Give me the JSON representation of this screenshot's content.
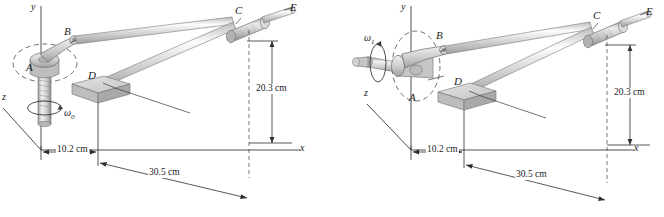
{
  "figure": {
    "background": "#ffffff",
    "line_color": "#333333",
    "metal_light": "#e8e8e8",
    "metal_mid": "#c3c3c3",
    "metal_dark": "#9a9a9a",
    "dash_color": "#555555"
  },
  "panels": [
    {
      "id": "left",
      "name": "vertical-shaft-configuration",
      "axes": {
        "x": "x",
        "y": "y",
        "z": "z"
      },
      "omega": {
        "symbol": "ω",
        "subscript": "0",
        "axis": "y",
        "label": "ω0"
      },
      "points": [
        {
          "id": "A",
          "label": "A"
        },
        {
          "id": "B",
          "label": "B"
        },
        {
          "id": "C",
          "label": "C"
        },
        {
          "id": "D",
          "label": "D"
        },
        {
          "id": "E",
          "label": "E"
        }
      ],
      "dimensions": [
        {
          "id": "d1",
          "label": "10.2 cm",
          "value": 10.2,
          "unit": "cm",
          "orientation": "horizontal"
        },
        {
          "id": "d2",
          "label": "30.5 cm",
          "value": 30.5,
          "unit": "cm",
          "orientation": "horizontal"
        },
        {
          "id": "d3",
          "label": "20.3 cm",
          "value": 20.3,
          "unit": "cm",
          "orientation": "vertical"
        }
      ]
    },
    {
      "id": "right",
      "name": "horizontal-shaft-configuration",
      "axes": {
        "x": "x",
        "y": "y",
        "z": "z"
      },
      "omega": {
        "symbol": "ω",
        "subscript": "1",
        "axis": "z",
        "label": "ω1"
      },
      "points": [
        {
          "id": "A",
          "label": "A"
        },
        {
          "id": "B",
          "label": "B"
        },
        {
          "id": "C",
          "label": "C"
        },
        {
          "id": "D",
          "label": "D"
        },
        {
          "id": "E",
          "label": "E"
        }
      ],
      "dimensions": [
        {
          "id": "d1",
          "label": "10.2 cm",
          "value": 10.2,
          "unit": "cm",
          "orientation": "horizontal"
        },
        {
          "id": "d2",
          "label": "30.5 cm",
          "value": 30.5,
          "unit": "cm",
          "orientation": "horizontal"
        },
        {
          "id": "d3",
          "label": "20.3 cm",
          "value": 20.3,
          "unit": "cm",
          "orientation": "vertical"
        }
      ]
    }
  ]
}
